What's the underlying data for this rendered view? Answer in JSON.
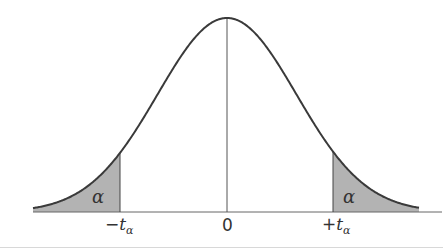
{
  "chart_data": {
    "type": "area",
    "title": "",
    "xlabel": "",
    "ylabel": "",
    "curve": "bell",
    "center_label": "0",
    "tick_labels": [
      "-t_α",
      "0",
      "+t_α"
    ],
    "shaded_regions": [
      {
        "side": "left",
        "from": "-∞",
        "to": "-t_α",
        "label": "α"
      },
      {
        "side": "right",
        "from": "+t_α",
        "to": "+∞",
        "label": "α"
      }
    ],
    "colors": {
      "curve": "#3a3a3a",
      "shade": "#b3b3b3",
      "axis": "#555555"
    }
  },
  "labels": {
    "left_alpha": "α",
    "right_alpha": "α",
    "neg_tick_sign": "−",
    "neg_tick_t": "t",
    "neg_tick_sub": "α",
    "zero": "0",
    "pos_tick_sign": "+",
    "pos_tick_t": "t",
    "pos_tick_sub": "α"
  }
}
